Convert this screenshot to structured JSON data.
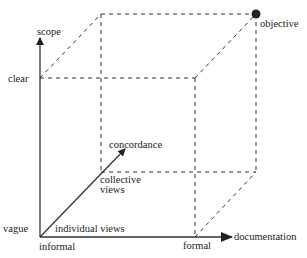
{
  "colors": {
    "line": "#333333",
    "text": "#222222",
    "point": "#222222",
    "background": "#ffffff"
  },
  "axes": {
    "y": {
      "name": "scope",
      "low": "vague",
      "high": "clear"
    },
    "x": {
      "name": "documentation",
      "low": "informal",
      "high": "formal"
    },
    "z": {
      "name": "concordance",
      "low": "individual views",
      "high_line1": "collective",
      "high_line2": "views"
    }
  },
  "point": {
    "label": "objective"
  }
}
